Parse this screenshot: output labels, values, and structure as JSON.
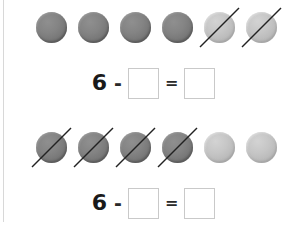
{
  "worksheet": {
    "background_color": "#ffffff",
    "margin_rule_color": "#d8d8d8",
    "counter_dark_color": "#7a7a7a",
    "counter_light_color": "#bcbcbc",
    "slash_color": "#222222",
    "box_border_color": "#c9c9c9"
  },
  "problems": [
    {
      "id": "problem-1",
      "counters": [
        {
          "shade": "dark",
          "crossed_out": false
        },
        {
          "shade": "dark",
          "crossed_out": false
        },
        {
          "shade": "dark",
          "crossed_out": false
        },
        {
          "shade": "dark",
          "crossed_out": false
        },
        {
          "shade": "light",
          "crossed_out": true
        },
        {
          "shade": "light",
          "crossed_out": true
        }
      ],
      "equation": {
        "first_number": "6",
        "minus_sign": "-",
        "equals_sign": "=",
        "subtrahend_value": "",
        "subtrahend_placeholder": "",
        "answer_value": "",
        "answer_placeholder": ""
      }
    },
    {
      "id": "problem-2",
      "counters": [
        {
          "shade": "dark",
          "crossed_out": true
        },
        {
          "shade": "dark",
          "crossed_out": true
        },
        {
          "shade": "dark",
          "crossed_out": true
        },
        {
          "shade": "dark",
          "crossed_out": true
        },
        {
          "shade": "light",
          "crossed_out": false
        },
        {
          "shade": "light",
          "crossed_out": false
        }
      ],
      "equation": {
        "first_number": "6",
        "minus_sign": "-",
        "equals_sign": "=",
        "subtrahend_value": "",
        "subtrahend_placeholder": "",
        "answer_value": "",
        "answer_placeholder": ""
      }
    }
  ]
}
